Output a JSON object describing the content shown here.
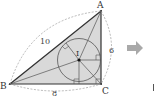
{
  "diagram": {
    "type": "geometry-incircle-right-triangle",
    "vertices": {
      "A": {
        "label": "A",
        "x": 101,
        "y": 11
      },
      "B": {
        "label": "B",
        "x": 10,
        "y": 84
      },
      "C": {
        "label": "C",
        "x": 101,
        "y": 84
      }
    },
    "incenter": {
      "label": "I",
      "x": 79,
      "y": 60
    },
    "incircle_radius": 24,
    "side_lengths": {
      "AB": "10",
      "AC": "6",
      "BC": "8"
    },
    "colors": {
      "triangle_fill": "#d9d9d9",
      "stroke": "#333333",
      "dashed": "#888888",
      "arrow": "#a9a9a9"
    },
    "arrow_icon": "right-arrow",
    "trailing_mark": "|"
  }
}
